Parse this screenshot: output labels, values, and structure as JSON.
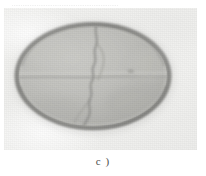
{
  "figure": {
    "caption": "c )",
    "top_running_text": "............................................................",
    "photo": {
      "description": "grayscale micrograph of elliptical specimen",
      "background_color": "#efefed",
      "specimen": {
        "shape": "ellipse",
        "center_x_pct": 46,
        "center_y_pct": 48,
        "radius_x_pct": 41,
        "radius_y_pct": 38,
        "rim_color": "#8d8d8b",
        "rim_inner_color": "#a9a9a6",
        "body_color": "#bdbdb9",
        "body_highlight_color": "#cfcfcb",
        "body_shadow_color": "#adadaa",
        "crack": {
          "name": "vertical-fracture",
          "color": "#8a8a88"
        },
        "seam": {
          "name": "horizontal-seam",
          "color": "#a0a09d"
        },
        "speck": {
          "name": "dark-speck",
          "color": "#9a9a97"
        }
      }
    }
  },
  "colors": {
    "paper": "#ffffff",
    "photo_base": "#efefed",
    "ink": "#4c4c4c"
  }
}
